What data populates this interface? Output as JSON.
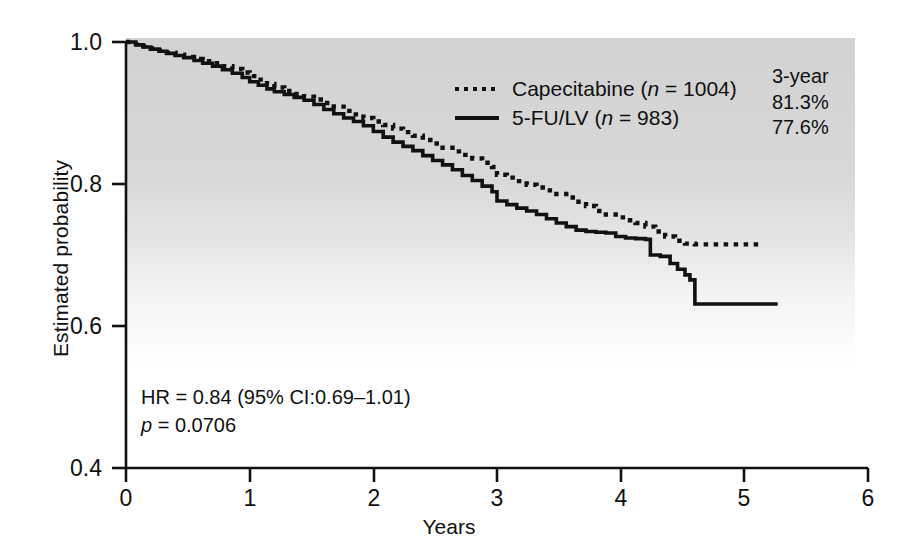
{
  "chart_data": {
    "type": "line",
    "title": "",
    "xlabel": "Years",
    "ylabel": "Estimated probability",
    "xlim": [
      0,
      6
    ],
    "ylim": [
      0.4,
      1.0
    ],
    "xticks": [
      "0",
      "1",
      "2",
      "3",
      "4",
      "5",
      "6"
    ],
    "yticks": [
      "1.0",
      "0.8",
      "0.6",
      "0.4"
    ],
    "grid": false,
    "legend_position": "upper-right",
    "series": [
      {
        "name": "Capecitabine",
        "n": 1004,
        "style": "dotted",
        "color": "#111111",
        "three_year_rate": "81.3%",
        "points": [
          [
            0.0,
            1.0
          ],
          [
            0.08,
            0.997
          ],
          [
            0.14,
            0.994
          ],
          [
            0.2,
            0.991
          ],
          [
            0.27,
            0.988
          ],
          [
            0.33,
            0.985
          ],
          [
            0.4,
            0.982
          ],
          [
            0.47,
            0.979
          ],
          [
            0.55,
            0.976
          ],
          [
            0.62,
            0.973
          ],
          [
            0.7,
            0.97
          ],
          [
            0.78,
            0.966
          ],
          [
            0.86,
            0.962
          ],
          [
            0.94,
            0.957
          ],
          [
            1.0,
            0.952
          ],
          [
            1.07,
            0.947
          ],
          [
            1.14,
            0.941
          ],
          [
            1.2,
            0.936
          ],
          [
            1.28,
            0.931
          ],
          [
            1.36,
            0.927
          ],
          [
            1.44,
            0.923
          ],
          [
            1.52,
            0.919
          ],
          [
            1.6,
            0.914
          ],
          [
            1.68,
            0.909
          ],
          [
            1.76,
            0.903
          ],
          [
            1.84,
            0.898
          ],
          [
            1.92,
            0.893
          ],
          [
            2.0,
            0.888
          ],
          [
            2.08,
            0.883
          ],
          [
            2.16,
            0.878
          ],
          [
            2.24,
            0.873
          ],
          [
            2.32,
            0.868
          ],
          [
            2.4,
            0.862
          ],
          [
            2.48,
            0.857
          ],
          [
            2.56,
            0.851
          ],
          [
            2.64,
            0.846
          ],
          [
            2.72,
            0.841
          ],
          [
            2.8,
            0.836
          ],
          [
            2.88,
            0.83
          ],
          [
            2.96,
            0.824
          ],
          [
            3.0,
            0.813
          ],
          [
            3.08,
            0.809
          ],
          [
            3.16,
            0.804
          ],
          [
            3.24,
            0.799
          ],
          [
            3.32,
            0.795
          ],
          [
            3.4,
            0.791
          ],
          [
            3.48,
            0.786
          ],
          [
            3.56,
            0.781
          ],
          [
            3.64,
            0.775
          ],
          [
            3.72,
            0.769
          ],
          [
            3.8,
            0.762
          ],
          [
            3.88,
            0.757
          ],
          [
            3.96,
            0.753
          ],
          [
            4.04,
            0.749
          ],
          [
            4.12,
            0.745
          ],
          [
            4.2,
            0.74
          ],
          [
            4.28,
            0.733
          ],
          [
            4.36,
            0.726
          ],
          [
            4.44,
            0.72
          ],
          [
            4.52,
            0.716
          ],
          [
            4.6,
            0.715
          ],
          [
            5.15,
            0.715
          ]
        ]
      },
      {
        "name": "5-FU/LV",
        "n": 983,
        "style": "solid",
        "color": "#111111",
        "three_year_rate": "77.6%",
        "points": [
          [
            0.0,
            1.0
          ],
          [
            0.08,
            0.996
          ],
          [
            0.14,
            0.993
          ],
          [
            0.2,
            0.99
          ],
          [
            0.27,
            0.987
          ],
          [
            0.33,
            0.984
          ],
          [
            0.4,
            0.981
          ],
          [
            0.47,
            0.978
          ],
          [
            0.55,
            0.974
          ],
          [
            0.62,
            0.97
          ],
          [
            0.7,
            0.966
          ],
          [
            0.78,
            0.961
          ],
          [
            0.86,
            0.956
          ],
          [
            0.94,
            0.95
          ],
          [
            1.0,
            0.944
          ],
          [
            1.07,
            0.939
          ],
          [
            1.14,
            0.934
          ],
          [
            1.2,
            0.93
          ],
          [
            1.28,
            0.926
          ],
          [
            1.36,
            0.922
          ],
          [
            1.44,
            0.918
          ],
          [
            1.52,
            0.912
          ],
          [
            1.6,
            0.905
          ],
          [
            1.68,
            0.899
          ],
          [
            1.76,
            0.893
          ],
          [
            1.84,
            0.888
          ],
          [
            1.92,
            0.882
          ],
          [
            2.0,
            0.874
          ],
          [
            2.08,
            0.866
          ],
          [
            2.16,
            0.859
          ],
          [
            2.24,
            0.853
          ],
          [
            2.32,
            0.847
          ],
          [
            2.4,
            0.84
          ],
          [
            2.48,
            0.833
          ],
          [
            2.56,
            0.827
          ],
          [
            2.64,
            0.82
          ],
          [
            2.72,
            0.812
          ],
          [
            2.8,
            0.805
          ],
          [
            2.88,
            0.797
          ],
          [
            2.96,
            0.789
          ],
          [
            3.0,
            0.776
          ],
          [
            3.08,
            0.771
          ],
          [
            3.16,
            0.766
          ],
          [
            3.24,
            0.762
          ],
          [
            3.32,
            0.757
          ],
          [
            3.4,
            0.751
          ],
          [
            3.48,
            0.745
          ],
          [
            3.56,
            0.74
          ],
          [
            3.64,
            0.735
          ],
          [
            3.72,
            0.733
          ],
          [
            3.8,
            0.732
          ],
          [
            3.88,
            0.731
          ],
          [
            3.96,
            0.726
          ],
          [
            4.04,
            0.724
          ],
          [
            4.12,
            0.723
          ],
          [
            4.2,
            0.722
          ],
          [
            4.24,
            0.7
          ],
          [
            4.32,
            0.698
          ],
          [
            4.4,
            0.688
          ],
          [
            4.46,
            0.68
          ],
          [
            4.52,
            0.672
          ],
          [
            4.56,
            0.665
          ],
          [
            4.6,
            0.631
          ],
          [
            5.27,
            0.631
          ]
        ]
      }
    ],
    "annotations": {
      "hazard_ratio": "HR = 0.84 (95% CI:0.69–1.01)",
      "p_value_prefix": "p",
      "p_value_rest": " = 0.0706",
      "summary_header": "3-year",
      "summary_values": [
        "81.3%",
        "77.6%"
      ]
    }
  },
  "legend": {
    "entries": [
      {
        "label_main": "Capecitabine (",
        "label_italic": "n",
        "label_tail": " = 1004)",
        "style": "dotted"
      },
      {
        "label_main": "5-FU/LV (",
        "label_italic": "n",
        "label_tail": " = 983)",
        "style": "solid"
      }
    ]
  }
}
